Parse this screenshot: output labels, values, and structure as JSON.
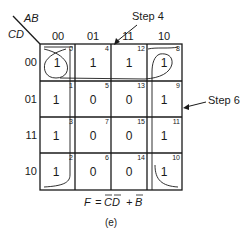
{
  "kmap": {
    "row_var": "CD",
    "col_var": "AB",
    "col_headers": [
      "00",
      "01",
      "11",
      "10"
    ],
    "row_headers": [
      "00",
      "01",
      "11",
      "10"
    ],
    "cells": [
      [
        {
          "value": "1",
          "index": "0"
        },
        {
          "value": "1",
          "index": "4"
        },
        {
          "value": "1",
          "index": "12"
        },
        {
          "value": "1",
          "index": "8"
        }
      ],
      [
        {
          "value": "1",
          "index": "1"
        },
        {
          "value": "0",
          "index": "5"
        },
        {
          "value": "0",
          "index": "13"
        },
        {
          "value": "1",
          "index": "9"
        }
      ],
      [
        {
          "value": "1",
          "index": "3"
        },
        {
          "value": "0",
          "index": "7"
        },
        {
          "value": "0",
          "index": "15"
        },
        {
          "value": "1",
          "index": "11"
        }
      ],
      [
        {
          "value": "1",
          "index": "2"
        },
        {
          "value": "0",
          "index": "6"
        },
        {
          "value": "0",
          "index": "14"
        },
        {
          "value": "1",
          "index": "10"
        }
      ]
    ]
  },
  "annotations": {
    "step4": "Step 4",
    "step6": "Step 6"
  },
  "formula": {
    "lhs": "F",
    "eq": "=",
    "term1": "CD",
    "plus": "+",
    "term2": "B"
  },
  "caption": "(e)"
}
